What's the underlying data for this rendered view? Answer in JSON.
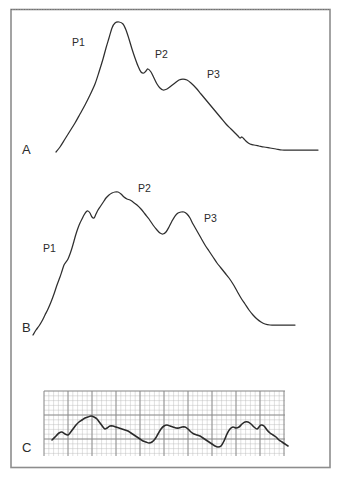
{
  "figure": {
    "title": "",
    "background_color": "#ffffff",
    "frame_color": "#8d8d8d",
    "trace_color": "#2e2e2e",
    "grid_color_fine": "#b9b9b9",
    "grid_color_bold": "#8a8a8a",
    "width": 343,
    "height": 480
  },
  "panels": [
    {
      "id": "A",
      "label": "A",
      "label_x": 22,
      "label_y": 154,
      "peak_labels": [
        {
          "text": "P1",
          "x": 72,
          "y": 46
        },
        {
          "text": "P2",
          "x": 155,
          "y": 58
        },
        {
          "text": "P3",
          "x": 207,
          "y": 78
        }
      ]
    },
    {
      "id": "B",
      "label": "B",
      "label_x": 22,
      "label_y": 332,
      "peak_labels": [
        {
          "text": "P1",
          "x": 43,
          "y": 252
        },
        {
          "text": "P2",
          "x": 138,
          "y": 192
        },
        {
          "text": "P3",
          "x": 204,
          "y": 222
        }
      ]
    },
    {
      "id": "C",
      "label": "C",
      "label_x": 22,
      "label_y": 452,
      "peak_labels": []
    }
  ],
  "chart_data": {
    "type": "line",
    "title": "",
    "xlabel": "",
    "ylabel": "",
    "grid": "panel C only (ECG-style fine and bold grid)",
    "legend": "none",
    "annotations": [
      "A",
      "B",
      "C",
      "P1",
      "P2",
      "P3"
    ],
    "series": [
      {
        "name": "A",
        "description": "Waveform A: triphasic pulse with dominant P1 peak, smaller P2 and P3 peaks, decaying to a flat baseline",
        "panel": "A",
        "peaks": [
          {
            "label": "P1",
            "x": 115,
            "y": 22
          },
          {
            "label": "P2",
            "x": 148,
            "y": 69
          },
          {
            "label": "P3",
            "x": 185,
            "y": 79
          }
        ],
        "points": [
          [
            56,
            152
          ],
          [
            60,
            147
          ],
          [
            65,
            139
          ],
          [
            70,
            131
          ],
          [
            75,
            123
          ],
          [
            80,
            114
          ],
          [
            85,
            105
          ],
          [
            90,
            95
          ],
          [
            95,
            84
          ],
          [
            99,
            72
          ],
          [
            103,
            59
          ],
          [
            106,
            48
          ],
          [
            109,
            38
          ],
          [
            112,
            28
          ],
          [
            115,
            23
          ],
          [
            119,
            22
          ],
          [
            123,
            24
          ],
          [
            126,
            30
          ],
          [
            129,
            39
          ],
          [
            132,
            49
          ],
          [
            135,
            58
          ],
          [
            138,
            66
          ],
          [
            141,
            72
          ],
          [
            144,
            73
          ],
          [
            146,
            71
          ],
          [
            148,
            69
          ],
          [
            151,
            72
          ],
          [
            154,
            78
          ],
          [
            157,
            84
          ],
          [
            160,
            88
          ],
          [
            163,
            90
          ],
          [
            167,
            89
          ],
          [
            171,
            86
          ],
          [
            175,
            83
          ],
          [
            179,
            80
          ],
          [
            183,
            79
          ],
          [
            187,
            80
          ],
          [
            191,
            83
          ],
          [
            196,
            88
          ],
          [
            201,
            94
          ],
          [
            206,
            100
          ],
          [
            211,
            106
          ],
          [
            216,
            112
          ],
          [
            221,
            118
          ],
          [
            226,
            124
          ],
          [
            231,
            129
          ],
          [
            235,
            133
          ],
          [
            238,
            136
          ],
          [
            240,
            138
          ],
          [
            242,
            137
          ],
          [
            244,
            139
          ],
          [
            247,
            142
          ],
          [
            250,
            144
          ],
          [
            254,
            145
          ],
          [
            259,
            146
          ],
          [
            264,
            147
          ],
          [
            270,
            148
          ],
          [
            276,
            149
          ],
          [
            282,
            150
          ],
          [
            288,
            150
          ],
          [
            295,
            150
          ],
          [
            303,
            150
          ],
          [
            311,
            150
          ],
          [
            318,
            150
          ]
        ]
      },
      {
        "name": "B",
        "description": "Waveform B: rising ramp with notched shoulder P1, dominant P2 peak, secondary P3 peak, then decline to flat baseline",
        "panel": "B",
        "peaks": [
          {
            "label": "P1",
            "x": 65,
            "y": 244
          },
          {
            "label": "P2",
            "x": 118,
            "y": 192
          },
          {
            "label": "P3",
            "x": 185,
            "y": 212
          }
        ],
        "points": [
          [
            33,
            335
          ],
          [
            36,
            330
          ],
          [
            39,
            326
          ],
          [
            42,
            321
          ],
          [
            45,
            315
          ],
          [
            48,
            309
          ],
          [
            51,
            302
          ],
          [
            54,
            294
          ],
          [
            57,
            285
          ],
          [
            60,
            277
          ],
          [
            62,
            271
          ],
          [
            64,
            265
          ],
          [
            66,
            262
          ],
          [
            68,
            259
          ],
          [
            70,
            254
          ],
          [
            72,
            248
          ],
          [
            74,
            241
          ],
          [
            76,
            234
          ],
          [
            78,
            228
          ],
          [
            80,
            223
          ],
          [
            82,
            219
          ],
          [
            84,
            215
          ],
          [
            86,
            212
          ],
          [
            88,
            211
          ],
          [
            90,
            213
          ],
          [
            92,
            217
          ],
          [
            94,
            218
          ],
          [
            96,
            214
          ],
          [
            98,
            210
          ],
          [
            100,
            207
          ],
          [
            102,
            204
          ],
          [
            104,
            201
          ],
          [
            106,
            198
          ],
          [
            109,
            195
          ],
          [
            112,
            193
          ],
          [
            115,
            192
          ],
          [
            118,
            192
          ],
          [
            121,
            194
          ],
          [
            124,
            197
          ],
          [
            127,
            199
          ],
          [
            130,
            200
          ],
          [
            133,
            202
          ],
          [
            137,
            205
          ],
          [
            141,
            209
          ],
          [
            145,
            214
          ],
          [
            149,
            219
          ],
          [
            153,
            225
          ],
          [
            157,
            230
          ],
          [
            160,
            233
          ],
          [
            163,
            234
          ],
          [
            166,
            232
          ],
          [
            169,
            227
          ],
          [
            172,
            221
          ],
          [
            175,
            216
          ],
          [
            178,
            213
          ],
          [
            181,
            212
          ],
          [
            184,
            212
          ],
          [
            187,
            214
          ],
          [
            190,
            218
          ],
          [
            193,
            224
          ],
          [
            197,
            231
          ],
          [
            201,
            238
          ],
          [
            205,
            245
          ],
          [
            209,
            251
          ],
          [
            213,
            257
          ],
          [
            217,
            263
          ],
          [
            221,
            268
          ],
          [
            225,
            273
          ],
          [
            229,
            278
          ],
          [
            233,
            284
          ],
          [
            237,
            291
          ],
          [
            241,
            298
          ],
          [
            245,
            304
          ],
          [
            249,
            310
          ],
          [
            253,
            315
          ],
          [
            257,
            319
          ],
          [
            261,
            322
          ],
          [
            265,
            324
          ],
          [
            270,
            325
          ],
          [
            276,
            325
          ],
          [
            283,
            325
          ],
          [
            289,
            325
          ],
          [
            295,
            325
          ]
        ]
      },
      {
        "name": "C",
        "description": "Waveform C: ECG-style continuous recording on gridded paper, undulating baseline with multiple small oscillations, downward drift to the right",
        "panel": "C",
        "points": [
          [
            52,
            440
          ],
          [
            56,
            436
          ],
          [
            59,
            433
          ],
          [
            62,
            432
          ],
          [
            65,
            434
          ],
          [
            68,
            435
          ],
          [
            70,
            433
          ],
          [
            73,
            429
          ],
          [
            76,
            425
          ],
          [
            79,
            422
          ],
          [
            82,
            420
          ],
          [
            85,
            418
          ],
          [
            88,
            417
          ],
          [
            91,
            416
          ],
          [
            94,
            417
          ],
          [
            97,
            419
          ],
          [
            100,
            423
          ],
          [
            103,
            427
          ],
          [
            105,
            429
          ],
          [
            107,
            428
          ],
          [
            110,
            426
          ],
          [
            113,
            426
          ],
          [
            116,
            427
          ],
          [
            119,
            428
          ],
          [
            122,
            429
          ],
          [
            125,
            430
          ],
          [
            128,
            431
          ],
          [
            131,
            433
          ],
          [
            134,
            435
          ],
          [
            137,
            437
          ],
          [
            140,
            439
          ],
          [
            143,
            441
          ],
          [
            146,
            442
          ],
          [
            149,
            443
          ],
          [
            152,
            442
          ],
          [
            155,
            439
          ],
          [
            158,
            434
          ],
          [
            161,
            429
          ],
          [
            164,
            426
          ],
          [
            167,
            425
          ],
          [
            170,
            426
          ],
          [
            173,
            427
          ],
          [
            176,
            428
          ],
          [
            179,
            428
          ],
          [
            182,
            427
          ],
          [
            185,
            427
          ],
          [
            188,
            429
          ],
          [
            191,
            432
          ],
          [
            194,
            434
          ],
          [
            197,
            435
          ],
          [
            200,
            436
          ],
          [
            203,
            438
          ],
          [
            206,
            440
          ],
          [
            209,
            442
          ],
          [
            212,
            444
          ],
          [
            215,
            446
          ],
          [
            218,
            447
          ],
          [
            221,
            446
          ],
          [
            224,
            441
          ],
          [
            227,
            434
          ],
          [
            230,
            429
          ],
          [
            233,
            427
          ],
          [
            236,
            428
          ],
          [
            239,
            427
          ],
          [
            242,
            424
          ],
          [
            245,
            422
          ],
          [
            248,
            422
          ],
          [
            251,
            424
          ],
          [
            254,
            427
          ],
          [
            257,
            429
          ],
          [
            259,
            427
          ],
          [
            261,
            425
          ],
          [
            264,
            426
          ],
          [
            267,
            430
          ],
          [
            270,
            433
          ],
          [
            273,
            435
          ],
          [
            276,
            437
          ],
          [
            279,
            440
          ],
          [
            282,
            442
          ],
          [
            285,
            444
          ],
          [
            288,
            446
          ]
        ],
        "grid": {
          "x0": 44,
          "y0": 391,
          "x1": 285,
          "y1": 456,
          "fine_step": 4.8,
          "bold_step": 24
        }
      }
    ]
  }
}
